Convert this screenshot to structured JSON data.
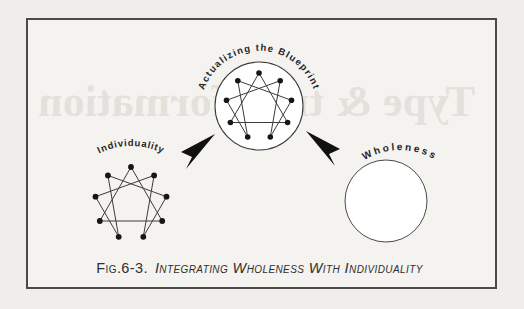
{
  "figure": {
    "caption_prefix": "Fig.6-3.",
    "caption_title": "Integrating Wholeness With Individuality"
  },
  "bleedthrough_text": "Type & transformation",
  "colors": {
    "paper": "#f0eeeb",
    "frame_fill": "#f5f3f0",
    "frame_border": "#4a4a4a",
    "ink": "#161616",
    "line": "#3c3c3c",
    "circle_stroke": "#4a4a4a",
    "label": "#262626"
  },
  "diagram": {
    "type": "enneagram-integration-diagram",
    "node_count": 9,
    "triangle": [
      9,
      3,
      6
    ],
    "hexad": [
      1,
      4,
      2,
      8,
      5,
      7
    ],
    "figures": [
      {
        "name": "actualizing-blueprint",
        "label": "Actualizing the Blueprint",
        "shape": "enneagram-in-circle"
      },
      {
        "name": "individuality",
        "label": "Individuality",
        "shape": "enneagram"
      },
      {
        "name": "wholeness",
        "label": "Wholeness",
        "shape": "empty-circle"
      }
    ],
    "arrows": [
      {
        "name": "arrow-left",
        "points_toward": "actualizing-blueprint"
      },
      {
        "name": "arrow-right",
        "points_toward": "actualizing-blueprint"
      }
    ]
  }
}
